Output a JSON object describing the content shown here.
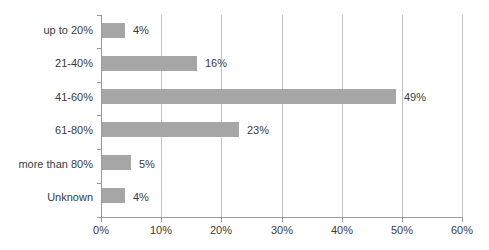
{
  "chart_data": {
    "type": "bar",
    "orientation": "horizontal",
    "title": "",
    "subtitle": "",
    "xlabel": "",
    "ylabel": "",
    "categories": [
      "up to 20%",
      "21-40%",
      "41-60%",
      "61-80%",
      "more than 80%",
      "Unknown"
    ],
    "values": [
      4,
      16,
      49,
      23,
      5,
      4
    ],
    "data_labels": [
      "4%",
      "16%",
      "49%",
      "23%",
      "5%",
      "4%"
    ],
    "xlim": [
      0,
      60
    ],
    "xticks": [
      0,
      10,
      20,
      30,
      40,
      50,
      60
    ],
    "xtick_labels": [
      "0%",
      "10%",
      "20%",
      "30%",
      "40%",
      "50%",
      "60%"
    ],
    "grid": "vertical",
    "legend": "none",
    "series": [
      {
        "name": "share",
        "values": [
          4,
          16,
          49,
          23,
          5,
          4
        ]
      }
    ],
    "colors": {
      "bar": "#a6a6a6",
      "gridline": "#c2c2c2",
      "axis": "#9a9a9a",
      "text": "#3b3b3b",
      "background": "#ffffff"
    }
  }
}
